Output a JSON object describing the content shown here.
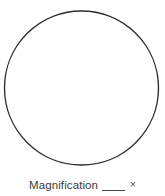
{
  "figure": {
    "name": "microscope-field-of-view-worksheet",
    "background_color": "#ffffff"
  },
  "field_of_view": {
    "shape": "circle",
    "center_x": 81.5,
    "center_y": 88,
    "radius": 77,
    "stroke_color": "#2e2e2e",
    "stroke_width": 1.4,
    "fill_color": "#ffffff",
    "fill_label": "empty"
  },
  "caption": {
    "label": "Magnification",
    "blank": "___",
    "unit_symbol": "×",
    "full_text": "Magnification ___ ×",
    "text_color": "#3b3b3b",
    "blank_value": ""
  }
}
